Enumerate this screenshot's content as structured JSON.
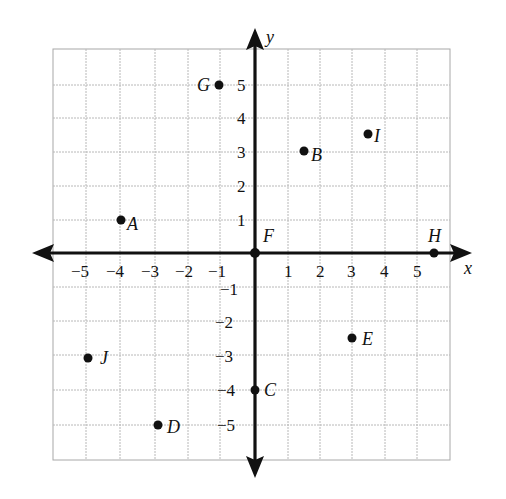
{
  "diagram": {
    "type": "coordinate-plane",
    "axes": {
      "x_label": "x",
      "y_label": "y",
      "range": [
        -6,
        6
      ],
      "x_ticks": [
        "−5",
        "−4",
        "−3",
        "−2",
        "−1",
        "1",
        "2",
        "3",
        "4",
        "5"
      ],
      "y_ticks_positive": [
        "1",
        "2",
        "3",
        "4",
        "5"
      ],
      "y_ticks_negative": [
        "−1",
        "−2",
        "−3",
        "−4",
        "−5"
      ]
    },
    "points": [
      {
        "label": "A",
        "x": -4,
        "y": 1
      },
      {
        "label": "B",
        "x": 1.5,
        "y": 3
      },
      {
        "label": "C",
        "x": 0,
        "y": -4
      },
      {
        "label": "D",
        "x": -3,
        "y": -5
      },
      {
        "label": "E",
        "x": 3,
        "y": -2.5
      },
      {
        "label": "F",
        "x": 0,
        "y": 0
      },
      {
        "label": "G",
        "x": -1,
        "y": 5
      },
      {
        "label": "H",
        "x": 5.5,
        "y": 0
      },
      {
        "label": "I",
        "x": 3.5,
        "y": 3.5
      },
      {
        "label": "J",
        "x": -5,
        "y": -3
      }
    ]
  }
}
